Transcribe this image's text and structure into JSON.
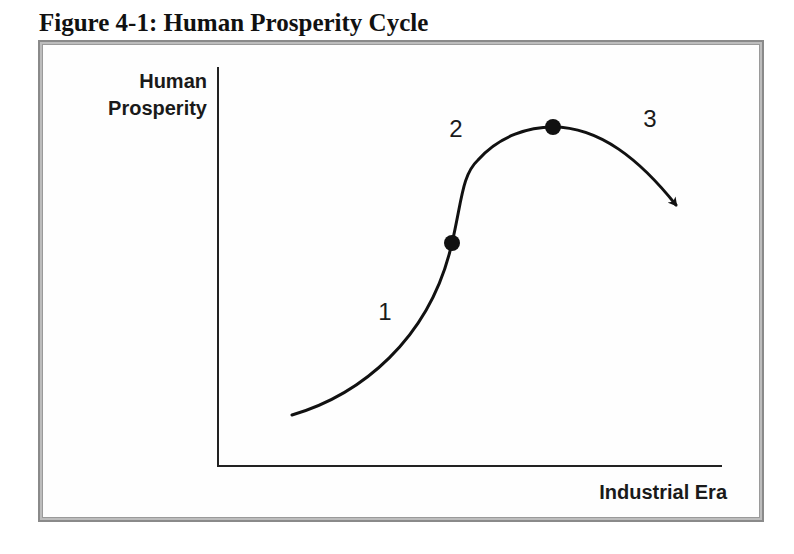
{
  "figure": {
    "title": "Figure 4-1: Human Prosperity Cycle",
    "y_axis_label_line1": "Human",
    "y_axis_label_line2": "Prosperity",
    "x_axis_label": "Industrial Era",
    "phase_labels": [
      "1",
      "2",
      "3"
    ],
    "markers": [
      {
        "name": "inflection-point",
        "x": 452,
        "y": 243
      },
      {
        "name": "peak-point",
        "x": 553,
        "y": 127
      }
    ],
    "colors": {
      "curve": "#111111",
      "axis": "#222222",
      "frame": "#8a8a8a",
      "text": "#1a1a1a"
    }
  }
}
